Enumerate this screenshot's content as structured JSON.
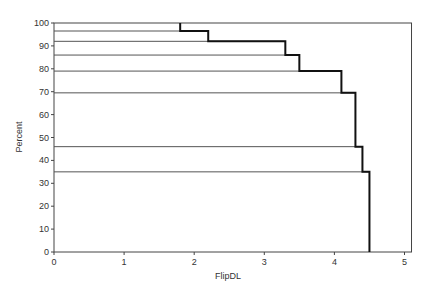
{
  "chart_data": {
    "type": "line",
    "subtype": "step",
    "title": "",
    "xlabel": "FlipDL",
    "ylabel": "Percent",
    "xlim": [
      0,
      5.1
    ],
    "ylim": [
      0,
      100
    ],
    "x_ticks": [
      0,
      1,
      2,
      3,
      4,
      5
    ],
    "y_ticks": [
      0,
      10,
      20,
      30,
      40,
      50,
      60,
      70,
      80,
      90,
      100
    ],
    "grid": false,
    "legend": null,
    "series": [
      {
        "name": "cumulative percent",
        "style": "bold-black-step",
        "points": [
          {
            "x": 1.8,
            "y": 100
          },
          {
            "x": 1.8,
            "y": 96.5
          },
          {
            "x": 2.2,
            "y": 96.5
          },
          {
            "x": 2.2,
            "y": 92
          },
          {
            "x": 3.3,
            "y": 92
          },
          {
            "x": 3.3,
            "y": 86
          },
          {
            "x": 3.5,
            "y": 86
          },
          {
            "x": 3.5,
            "y": 79
          },
          {
            "x": 4.1,
            "y": 79
          },
          {
            "x": 4.1,
            "y": 69.5
          },
          {
            "x": 4.3,
            "y": 69.5
          },
          {
            "x": 4.3,
            "y": 46
          },
          {
            "x": 4.4,
            "y": 46
          },
          {
            "x": 4.4,
            "y": 35
          },
          {
            "x": 4.5,
            "y": 35
          },
          {
            "x": 4.5,
            "y": 0
          }
        ]
      }
    ],
    "reference_lines": {
      "description": "thin gray horizontal lines from y-axis to the step curve at each step level",
      "levels": [
        {
          "y": 96.5,
          "x_end": 2.2
        },
        {
          "y": 92,
          "x_end": 3.3
        },
        {
          "y": 86,
          "x_end": 3.5
        },
        {
          "y": 79,
          "x_end": 4.1
        },
        {
          "y": 69.5,
          "x_end": 4.3
        },
        {
          "y": 46,
          "x_end": 4.4
        },
        {
          "y": 35,
          "x_end": 4.5
        }
      ]
    }
  },
  "axes": {
    "x_title": "FlipDL",
    "y_title": "Percent",
    "x_tick_labels": [
      "0",
      "1",
      "2",
      "3",
      "4",
      "5"
    ],
    "y_tick_labels": [
      "0",
      "10",
      "20",
      "30",
      "40",
      "50",
      "60",
      "70",
      "80",
      "90",
      "100"
    ]
  },
  "colors": {
    "step_line": "#111111",
    "reference_line": "#555555",
    "frame": "#444444"
  }
}
